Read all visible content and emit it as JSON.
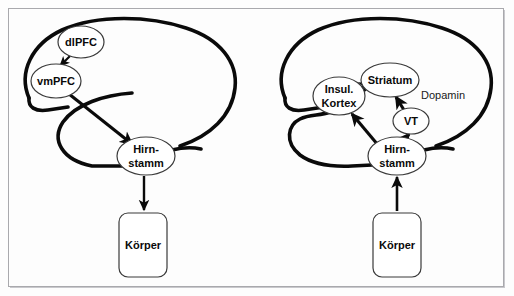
{
  "figure": {
    "background_color": "#fdfdfd",
    "frame_color": "#a9a9ad",
    "ink_color": "#0a0a0a"
  },
  "diagrams": [
    {
      "id": "left-brain",
      "nodes": [
        {
          "id": "dlpfc",
          "label": "dlPFC",
          "shape": "ellipse",
          "cx": 81,
          "cy": 42,
          "rx": 23,
          "ry": 16
        },
        {
          "id": "vmpfc",
          "label": "vmPFC",
          "shape": "ellipse",
          "cx": 56,
          "cy": 81,
          "rx": 25,
          "ry": 17
        },
        {
          "id": "hirnstamm",
          "label": "Hirn-",
          "label2": "stamm",
          "shape": "ellipse",
          "cx": 146,
          "cy": 156,
          "rx": 29,
          "ry": 19
        },
        {
          "id": "koerper",
          "label": "Körper",
          "shape": "rounded-rect",
          "x": 119,
          "y": 213,
          "w": 48,
          "h": 64
        }
      ],
      "edges": [
        {
          "from": "dlpfc",
          "to": "vmpfc"
        },
        {
          "from": "vmpfc",
          "to": "hirnstamm"
        },
        {
          "from": "hirnstamm",
          "to": "koerper"
        }
      ]
    },
    {
      "id": "right-brain",
      "nodes": [
        {
          "id": "insul-kortex",
          "label": "Insul.",
          "label2": "Kortex",
          "shape": "ellipse",
          "cx": 339,
          "cy": 96,
          "rx": 26,
          "ry": 19
        },
        {
          "id": "striatum",
          "label": "Striatum",
          "shape": "ellipse",
          "cx": 390,
          "cy": 80,
          "rx": 29,
          "ry": 17
        },
        {
          "id": "vt",
          "label": "VT",
          "shape": "ellipse",
          "cx": 411,
          "cy": 121,
          "rx": 18,
          "ry": 13
        },
        {
          "id": "hirnstamm",
          "label": "Hirn-",
          "label2": "stamm",
          "shape": "ellipse",
          "cx": 397,
          "cy": 156,
          "rx": 29,
          "ry": 19
        },
        {
          "id": "koerper",
          "label": "Körper",
          "shape": "rounded-rect",
          "x": 373,
          "y": 213,
          "w": 48,
          "h": 64
        }
      ],
      "annotations": [
        {
          "id": "dopamin",
          "label": "Dopamin",
          "x": 421,
          "y": 96
        }
      ],
      "edges": [
        {
          "from": "insul-kortex",
          "to": "striatum"
        },
        {
          "from": "vt",
          "to": "striatum"
        },
        {
          "from": "hirnstamm",
          "to": "insul-kortex"
        },
        {
          "from": "hirnstamm",
          "to": "vt"
        },
        {
          "from": "koerper",
          "to": "hirnstamm"
        }
      ]
    }
  ]
}
